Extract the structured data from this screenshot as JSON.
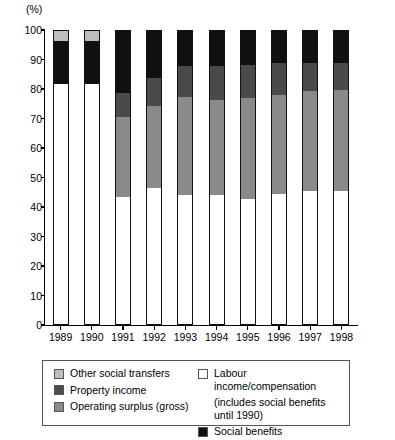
{
  "chart_data": {
    "type": "bar",
    "stacked": true,
    "title": "",
    "subtitle": "",
    "xlabel": "",
    "ylabel": "(%)",
    "unit_label": "(%)",
    "ylim": [
      0,
      100
    ],
    "yticks": [
      0,
      10,
      20,
      30,
      40,
      50,
      60,
      70,
      80,
      90,
      100
    ],
    "ytick_labels": [
      "0",
      "10",
      "20",
      "30",
      "40",
      "50",
      "60",
      "70",
      "80",
      "90",
      "100"
    ],
    "grid": false,
    "legend_position": "below",
    "categories": [
      "1989",
      "1990",
      "1991",
      "1992",
      "1993",
      "1994",
      "1995",
      "1996",
      "1997",
      "1998"
    ],
    "series": [
      {
        "name": "Labour income/compensation",
        "legend_label": "Labour income/compensation",
        "legend_note": "(includes social benefits until 1990)",
        "color": "#ffffff",
        "values": [
          82,
          82,
          43.5,
          46.5,
          44,
          44,
          42.5,
          44.5,
          45.5,
          45.5
        ]
      },
      {
        "name": "Operating surplus (gross)",
        "legend_label": "Operating surplus (gross)",
        "color": "#8a8a8a",
        "values": [
          0,
          0,
          27,
          28,
          33.5,
          32.5,
          34.5,
          33.5,
          34,
          34.5
        ]
      },
      {
        "name": "Property income",
        "legend_label": "Property income",
        "color": "#4a4a4a",
        "values": [
          0,
          0,
          8.5,
          9.5,
          10.5,
          11.5,
          11.5,
          11,
          9.5,
          9
        ]
      },
      {
        "name": "Social benefits",
        "legend_label": "Social benefits",
        "color": "#101010",
        "values": [
          14.5,
          14.5,
          21,
          16,
          12,
          12,
          11.5,
          11,
          11,
          11
        ]
      },
      {
        "name": "Other social transfers",
        "legend_label": "Other social transfers",
        "color": "#bdbdbd",
        "values": [
          3.5,
          3.5,
          0,
          0,
          0,
          0,
          0,
          0,
          0,
          0
        ]
      }
    ]
  },
  "legend": {
    "left_items": [
      {
        "label": "Other social transfers",
        "color": "#bdbdbd"
      },
      {
        "label": "Property income",
        "color": "#4a4a4a"
      },
      {
        "label": "Operating surplus (gross)",
        "color": "#8a8a8a"
      }
    ],
    "right_items": [
      {
        "label": "Labour income/compensation",
        "color": "#ffffff",
        "note_line1": "(includes social benefits",
        "note_line2": "until 1990)"
      },
      {
        "label": "Social benefits",
        "color": "#101010"
      }
    ]
  }
}
